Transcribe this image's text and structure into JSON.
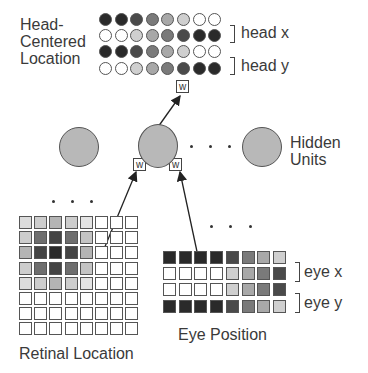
{
  "labels": {
    "head_centered": "Head-\nCentered\nLocation",
    "head_x": "head x",
    "head_y": "head y",
    "hidden_units": "Hidden\nUnits",
    "eye_x": "eye x",
    "eye_y": "eye y",
    "eye_position": "Eye Position",
    "retinal_location": "Retinal Location",
    "weight": "w",
    "ellipsis": ". . ."
  },
  "colors": {
    "black": "#2a2a2a",
    "dark": "#4a4a4a",
    "mid_dark": "#6e6e6e",
    "mid": "#939393",
    "light": "#b8b8b8",
    "lighter": "#d2d2d2",
    "white": "#ffffff",
    "hidden_unit_fill": "#b8b8b8"
  },
  "head_centered_rows": [
    [
      "#2a2a2a",
      "#2a2a2a",
      "#4a4a4a",
      "#7a7a7a",
      "#a8a8a8",
      "#cfcfcf",
      "#ffffff",
      "#ffffff"
    ],
    [
      "#ffffff",
      "#ffffff",
      "#cfcfcf",
      "#a8a8a8",
      "#7a7a7a",
      "#4a4a4a",
      "#2a2a2a",
      "#2a2a2a"
    ],
    [
      "#2a2a2a",
      "#2a2a2a",
      "#4a4a4a",
      "#7a7a7a",
      "#a8a8a8",
      "#cfcfcf",
      "#ffffff",
      "#ffffff"
    ],
    [
      "#ffffff",
      "#ffffff",
      "#cfcfcf",
      "#a8a8a8",
      "#7a7a7a",
      "#4a4a4a",
      "#2a2a2a",
      "#2a2a2a"
    ]
  ],
  "eye_position_rows": [
    [
      "#2a2a2a",
      "#2a2a2a",
      "#2a2a2a",
      "#2a2a2a",
      "#4a4a4a",
      "#7a7a7a",
      "#a8a8a8",
      "#cfcfcf"
    ],
    [
      "#ffffff",
      "#ffffff",
      "#ffffff",
      "#ffffff",
      "#cfcfcf",
      "#a8a8a8",
      "#7a7a7a",
      "#4a4a4a"
    ],
    [
      "#ffffff",
      "#ffffff",
      "#ffffff",
      "#ffffff",
      "#cfcfcf",
      "#a8a8a8",
      "#7a7a7a",
      "#4a4a4a"
    ],
    [
      "#2a2a2a",
      "#2a2a2a",
      "#2a2a2a",
      "#2a2a2a",
      "#4a4a4a",
      "#7a7a7a",
      "#a8a8a8",
      "#cfcfcf"
    ]
  ],
  "retinal_rows": [
    [
      "#dcdcdc",
      "#cdcdcd",
      "#b4b4b4",
      "#cdcdcd",
      "#e4e4e4",
      "#ffffff",
      "#ffffff",
      "#ffffff"
    ],
    [
      "#cdcdcd",
      "#6e6e6e",
      "#444444",
      "#6e6e6e",
      "#c4c4c4",
      "#ffffff",
      "#ffffff",
      "#ffffff"
    ],
    [
      "#b4b4b4",
      "#444444",
      "#2a2a2a",
      "#444444",
      "#b4b4b4",
      "#ffffff",
      "#ffffff",
      "#ffffff"
    ],
    [
      "#cdcdcd",
      "#6e6e6e",
      "#444444",
      "#6e6e6e",
      "#c4c4c4",
      "#ffffff",
      "#ffffff",
      "#ffffff"
    ],
    [
      "#dcdcdc",
      "#cdcdcd",
      "#b4b4b4",
      "#cdcdcd",
      "#e4e4e4",
      "#ffffff",
      "#ffffff",
      "#ffffff"
    ],
    [
      "#ffffff",
      "#ffffff",
      "#ffffff",
      "#ffffff",
      "#ffffff",
      "#ffffff",
      "#ffffff",
      "#ffffff"
    ],
    [
      "#ffffff",
      "#ffffff",
      "#ffffff",
      "#ffffff",
      "#ffffff",
      "#ffffff",
      "#ffffff",
      "#ffffff"
    ],
    [
      "#ffffff",
      "#ffffff",
      "#ffffff",
      "#ffffff",
      "#ffffff",
      "#ffffff",
      "#ffffff",
      "#ffffff"
    ]
  ]
}
